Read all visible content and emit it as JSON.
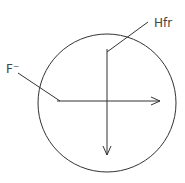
{
  "diagram": {
    "labels": {
      "hfr": "Hfr",
      "f_minus": "F⁻"
    },
    "colors": {
      "line": "#333333",
      "text": "#444444",
      "background": "#ffffff"
    }
  }
}
